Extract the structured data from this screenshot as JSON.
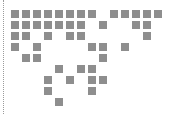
{
  "grid": {
    "origin_x": 11,
    "origin_y": 10,
    "pitch": 11,
    "cell_size": 8,
    "color": "#8e8e8e",
    "rows": [
      [
        0,
        1,
        2,
        3,
        4,
        5,
        6,
        7,
        9,
        10,
        11,
        12,
        13
      ],
      [
        0,
        1,
        2,
        3,
        4,
        5,
        6,
        8,
        11,
        12
      ],
      [
        0,
        1,
        3,
        5,
        6,
        12
      ],
      [
        0,
        2,
        7,
        8,
        10
      ],
      [
        1,
        2,
        8
      ],
      [
        4,
        6,
        7
      ],
      [
        3,
        5,
        7,
        8
      ],
      [
        3,
        7
      ],
      [
        4
      ]
    ]
  }
}
